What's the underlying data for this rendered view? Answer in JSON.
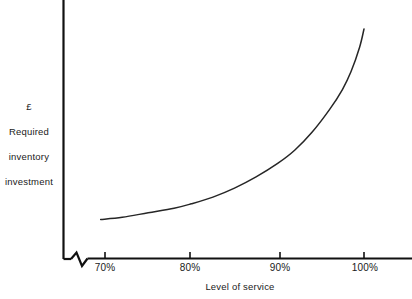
{
  "chart_data": {
    "type": "line",
    "title": "",
    "subtitle": "",
    "xlabel": "Level of service",
    "ylabel": "£ Required inventory investment",
    "ylabel_lines": [
      "£",
      "Required",
      "inventory",
      "investment"
    ],
    "xticklabels": [
      "70%",
      "80%",
      "90%",
      "100%"
    ],
    "xtickvalues": [
      70,
      80,
      90,
      100
    ],
    "yticklabels": [],
    "xlim": [
      70,
      104
    ],
    "ylim": [
      0,
      100
    ],
    "grid": false,
    "legend": null,
    "axis_break": {
      "axis": "x",
      "present": true,
      "note": "zigzag break on x-axis between origin and 70%"
    },
    "annotations": [],
    "series": [
      {
        "name": "Required inventory investment",
        "color": "#262626",
        "x": [
          69.5,
          72,
          75,
          78,
          80,
          82.5,
          85,
          87.5,
          90,
          92,
          94,
          96,
          97.5,
          98.5,
          99.5,
          100
        ],
        "y": [
          11,
          12,
          14,
          16,
          18,
          21,
          25,
          30,
          36,
          42,
          50,
          60,
          69,
          77,
          88,
          96
        ]
      }
    ]
  },
  "figure": {
    "axis_color": "#111111",
    "curve_color": "#2a2a2a",
    "background": "#ffffff",
    "y_axis_label_block": "£\nRequired\ninventory\ninvestment",
    "x_axis_label": "Level of service"
  },
  "ticks": [
    {
      "label": "70%",
      "left": 105
    },
    {
      "label": "80%",
      "left": 190
    },
    {
      "label": "90%",
      "left": 280
    },
    {
      "label": "100%",
      "left": 365
    }
  ]
}
